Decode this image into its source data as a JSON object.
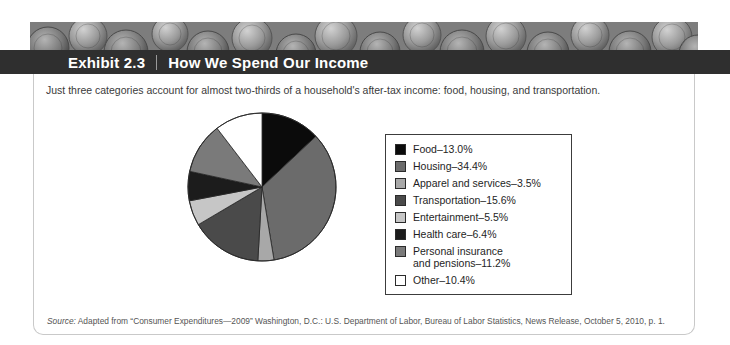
{
  "header": {
    "exhibit_label": "Exhibit 2.3",
    "title": "How We Spend Our Income"
  },
  "caption": "Just three categories account for almost two-thirds of a household's after-tax income: food, housing, and transportation.",
  "source": {
    "prefix": "Source:",
    "text": " Adapted from “Consumer Expenditures—2009” Washington, D.C.: U.S. Department of Labor, Bureau of Labor Statistics, News Release, October 5, 2010, p. 1."
  },
  "chart_data": {
    "type": "pie",
    "title": "How We Spend Our Income",
    "subtitle": "Just three categories account for almost two-thirds of a household's after-tax income: food, housing, and transportation.",
    "legend_position": "right",
    "unit": "%",
    "categories": [
      "Food",
      "Housing",
      "Apparel and services",
      "Transportation",
      "Entertainment",
      "Health care",
      "Personal insurance and pensions",
      "Other"
    ],
    "values": [
      13.0,
      34.4,
      3.5,
      15.6,
      5.5,
      6.4,
      11.2,
      10.4
    ],
    "colors": [
      "#0b0b0b",
      "#6b6b6b",
      "#a8a8a8",
      "#4a4a4a",
      "#c6c6c6",
      "#1c1c1c",
      "#7a7a7a",
      "#ffffff"
    ],
    "legend": [
      {
        "label": "Food–13.0%",
        "color": "#0b0b0b",
        "name": "food"
      },
      {
        "label": "Housing–34.4%",
        "color": "#6b6b6b",
        "name": "housing"
      },
      {
        "label": "Apparel and services–3.5%",
        "color": "#a8a8a8",
        "name": "apparel-and-services"
      },
      {
        "label": "Transportation–15.6%",
        "color": "#4a4a4a",
        "name": "transportation"
      },
      {
        "label": "Entertainment–5.5%",
        "color": "#c6c6c6",
        "name": "entertainment"
      },
      {
        "label": "Health care–6.4%",
        "color": "#1c1c1c",
        "name": "health-care"
      },
      {
        "label": "Personal insurance\nand pensions–11.2%",
        "color": "#7a7a7a",
        "name": "personal-insurance-and-pensions"
      },
      {
        "label": "Other–10.4%",
        "color": "#ffffff",
        "name": "other"
      }
    ]
  }
}
